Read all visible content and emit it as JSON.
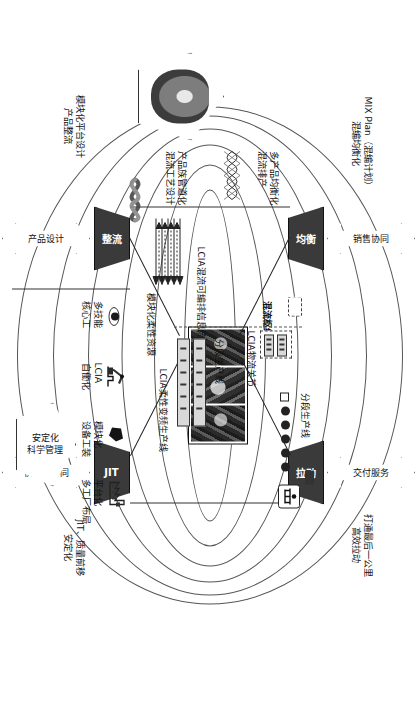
{
  "diagram": {
    "center": {
      "hub_label": "混流枢纽",
      "line_label": "LCIA柔性变频生产线"
    },
    "nodes": [
      {
        "id": "junheng",
        "label": "均衡"
      },
      {
        "id": "ladong",
        "label": "拉动"
      },
      {
        "id": "zhengliu",
        "label": "整流"
      },
      {
        "id": "jit",
        "label": "JIT"
      }
    ],
    "arrows": [
      {
        "id": "sales",
        "label": "销售协同"
      },
      {
        "id": "delivery",
        "label": "交付服务"
      },
      {
        "id": "product",
        "label": "产品设计"
      },
      {
        "id": "supplier",
        "label": "供应商协同"
      }
    ],
    "outer_captions": [
      {
        "id": "mix-plan",
        "line1": "MIX Plan（混编计划）",
        "line2": "混编均衡化"
      },
      {
        "id": "last-mile",
        "line1": "打通最后一公里",
        "line2": "高效拉动"
      },
      {
        "id": "platform",
        "line1": "模块化平台设计",
        "line2": "产品整流"
      },
      {
        "id": "jit-quality",
        "line1": "JIT、质量前移",
        "line2": "安定化"
      }
    ],
    "edge_captions": [
      {
        "id": "multi-product",
        "line1": "多产品均衡化",
        "line2": "混流排产"
      },
      {
        "id": "product-family",
        "line1": "产品族管道化",
        "line2": "混流工艺设计"
      },
      {
        "id": "info-flow",
        "label": "LCIA混流可编排信息流"
      }
    ],
    "pentagons": [
      {
        "id": "photo-pentagon",
        "line1": "",
        "line2": ""
      },
      {
        "id": "stability-pentagon",
        "line1": "安定化",
        "line2": "科学管理"
      }
    ],
    "right_resources": {
      "header": "模块化柔性资源",
      "items": [
        {
          "icon": "multi-skill-icon",
          "line1": "多技能",
          "line2": "核心工"
        },
        {
          "icon": "lcia-robot-icon",
          "line1": "LCIA",
          "line2": "自働化"
        },
        {
          "icon": "module-icon",
          "line1": "模块化",
          "line2": "设备工装"
        },
        {
          "icon": "factory-icon",
          "line1": "平台化",
          "line2": "多工厂布局"
        }
      ]
    },
    "line_annotations": [
      {
        "id": "segmented-line-top",
        "label": "分段生产线"
      },
      {
        "id": "segmented-line-bottom",
        "label": "分段生产线"
      },
      {
        "id": "logistics-joint",
        "label": "LCIA物流关节"
      }
    ],
    "colors": {
      "node_fill": "#3a3a3a",
      "node_text": "#ffffff",
      "stroke": "#333333",
      "arrow_stroke": "#4a4a4a",
      "background": "#ffffff"
    }
  }
}
